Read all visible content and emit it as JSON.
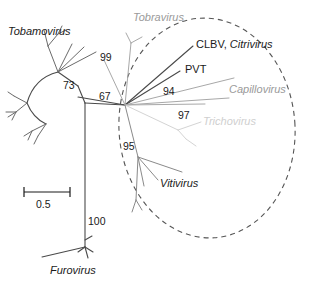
{
  "figure": {
    "type": "unrooted-phylogenetic-tree",
    "background": "#ffffff",
    "width": 311,
    "height": 285
  },
  "colors": {
    "branch_dark": "#4a4a4a",
    "branch_gray": "#9a9a9a",
    "branch_faint": "#d2d2d2",
    "text_dark": "#1a1a1a",
    "text_gray": "#9a9a9a",
    "text_faint": "#cfcfcf",
    "ellipse": "#555555"
  },
  "taxa": {
    "tobamovirus": "Tobamovirus",
    "tobravirus": "Tobravirus",
    "citrivirus": "Citrivirus",
    "clbv_prefix": "CLBV, ",
    "pvt": "PVT",
    "capillovirus": "Capillovirus",
    "trichovirus": "Trichovirus",
    "vitivirus": "Vitivirus",
    "furovirus": "Furovirus"
  },
  "bootstrap": {
    "b73": "73",
    "b99": "99",
    "b67": "67",
    "b94": "94",
    "b97": "97",
    "b95": "95",
    "b100": "100"
  },
  "scale": {
    "value": "0.5"
  }
}
